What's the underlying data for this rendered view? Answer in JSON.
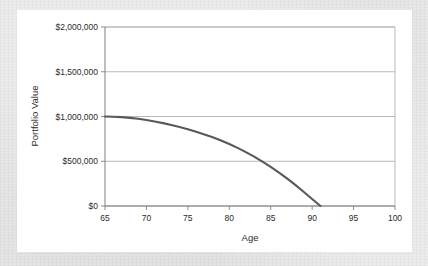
{
  "chart_data": {
    "type": "line",
    "title": "",
    "xlabel": "Age",
    "ylabel": "Portfolio Value",
    "xlim": [
      65,
      100
    ],
    "ylim": [
      0,
      2000000
    ],
    "grid": true,
    "legend": false,
    "legend_position": "none",
    "x_ticks": [
      65,
      70,
      75,
      80,
      85,
      90,
      95,
      100
    ],
    "x_tick_labels": [
      "65",
      "70",
      "75",
      "80",
      "85",
      "90",
      "95",
      "100"
    ],
    "y_ticks": [
      0,
      500000,
      1000000,
      1500000,
      2000000
    ],
    "y_tick_labels": [
      "$0",
      "$500,000",
      "$1,000,000",
      "$1,500,000",
      "$2,000,000"
    ],
    "line_color": "#595959",
    "series": [
      {
        "name": "Portfolio Value",
        "x": [
          65,
          66,
          67,
          68,
          69,
          70,
          71,
          72,
          73,
          74,
          75,
          76,
          77,
          78,
          79,
          80,
          81,
          82,
          83,
          84,
          85,
          86,
          87,
          88,
          89,
          90,
          91
        ],
        "values": [
          1000000,
          998000,
          993000,
          985000,
          974000,
          960000,
          944000,
          926000,
          906000,
          883000,
          858000,
          830000,
          800000,
          767000,
          731000,
          692000,
          649000,
          602000,
          551000,
          496000,
          437000,
          374000,
          306000,
          233000,
          156000,
          78000,
          0
        ]
      }
    ]
  },
  "axes": {
    "y_label": "Portfolio Value",
    "x_label": "Age"
  }
}
